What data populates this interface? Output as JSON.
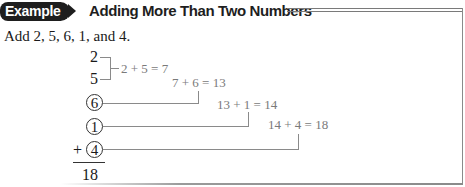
{
  "header": {
    "badge_label": "Example 2",
    "title": "Adding More Than Two Numbers"
  },
  "prompt": "Add 2, 5, 6, 1, and 4.",
  "addends": [
    "2",
    "5",
    "6",
    "1",
    "4"
  ],
  "plus_sign": "+",
  "steps": [
    "2 + 5 = 7",
    "7 + 6 = 13",
    "13 + 1 = 14",
    "14 + 4 = 18"
  ],
  "result": "18",
  "colors": {
    "badge_bg": "#1e1e1e",
    "badge_text": "#ffffff",
    "step_text": "#7a7a7a",
    "connector_lines": "#8a8a8a"
  }
}
